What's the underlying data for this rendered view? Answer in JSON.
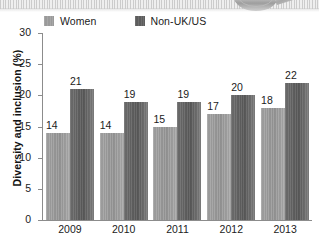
{
  "decoration": {
    "top_band_name": "scanned-page-edge",
    "spoon_name": "metallic-spoon-photo"
  },
  "chart_data": {
    "type": "bar",
    "title": "",
    "subtitle": "",
    "xlabel": "",
    "ylabel": "Diversity and inclusion (%)",
    "categories": [
      "2009",
      "2010",
      "2011",
      "2012",
      "2013"
    ],
    "series": [
      {
        "name": "Women",
        "color": "#9a9a9a",
        "values": [
          14,
          14,
          15,
          17,
          18
        ]
      },
      {
        "name": "Non-UK/US",
        "color": "#5d5d5d",
        "values": [
          21,
          19,
          19,
          20,
          22
        ]
      }
    ],
    "ylim": [
      0,
      30
    ],
    "yticks": [
      0,
      5,
      10,
      15,
      20,
      25,
      30
    ],
    "ytick_labels": [
      "0",
      "5",
      "10",
      "15",
      "20",
      "25",
      "30"
    ],
    "grid": false,
    "legend_position": "top-left",
    "data_labels": true
  }
}
